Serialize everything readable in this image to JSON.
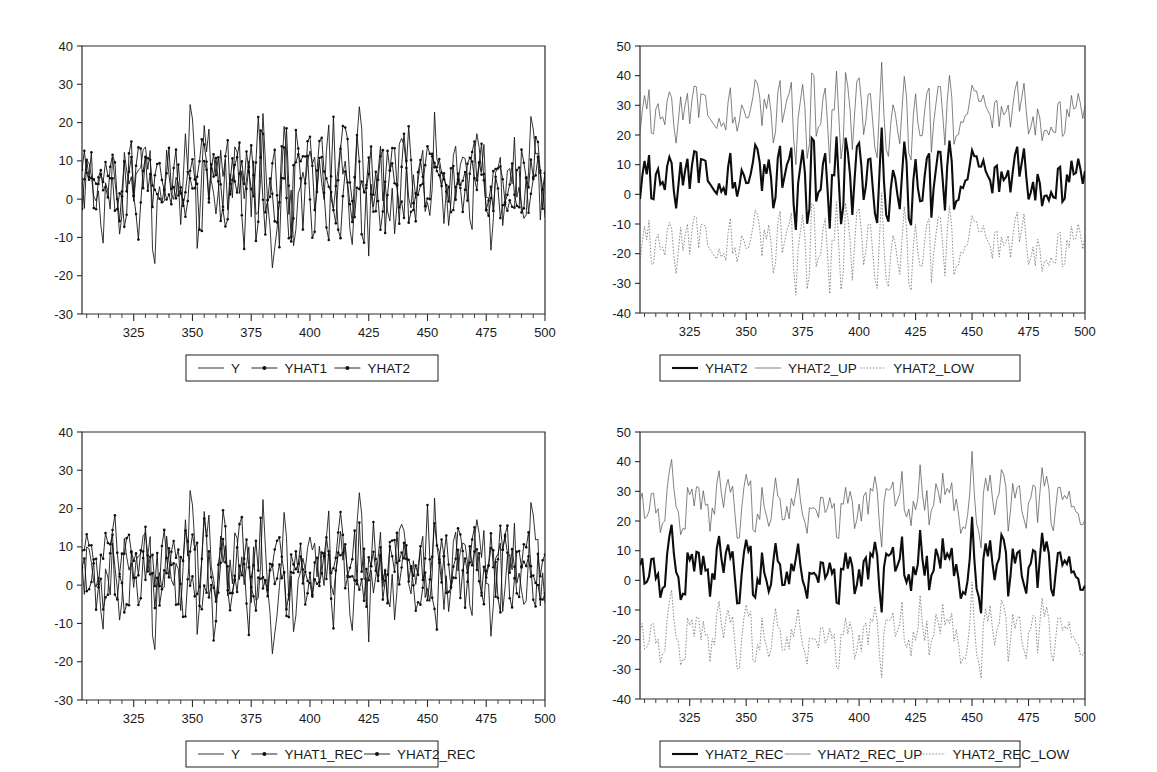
{
  "figure": {
    "layout": "2x2 grid of time series line plots",
    "background": "#ffffff",
    "ink_color": "#111111"
  },
  "chart_data": [
    {
      "id": "top-left",
      "type": "line",
      "title": "",
      "xlabel": "",
      "ylabel": "",
      "xlim": [
        303,
        500
      ],
      "ylim": [
        -30,
        40
      ],
      "ytick_labels": [
        "40",
        "30",
        "20",
        "10",
        "0",
        "-10",
        "-20",
        "-30"
      ],
      "ytick_values": [
        40,
        30,
        20,
        10,
        0,
        -10,
        -20,
        -30
      ],
      "xtick_labels": [
        "325",
        "350",
        "375",
        "400",
        "425",
        "450",
        "475",
        "500"
      ],
      "xtick_values": [
        325,
        350,
        375,
        400,
        425,
        450,
        475,
        500
      ],
      "minor_xtick_step": 5,
      "grid": false,
      "legend_position": "below-center",
      "series": [
        {
          "name": "Y",
          "style": "solid-thin",
          "marker": "none",
          "seed": 11,
          "amp": 16,
          "mean": 4.5,
          "n": 198
        },
        {
          "name": "YHAT1",
          "style": "solid-marker",
          "marker": "dot",
          "seed": 29,
          "amp": 12.5,
          "mean": 4.5,
          "n": 198
        },
        {
          "name": "YHAT2",
          "style": "solid-marker",
          "marker": "dot",
          "seed": 47,
          "amp": 12.0,
          "mean": 4.5,
          "n": 198
        }
      ],
      "legend": [
        "Y",
        "YHAT1",
        "YHAT2"
      ]
    },
    {
      "id": "top-right",
      "type": "line",
      "title": "",
      "xlabel": "",
      "ylabel": "",
      "xlim": [
        303,
        500
      ],
      "ylim": [
        -40,
        50
      ],
      "ytick_labels": [
        "50",
        "40",
        "30",
        "20",
        "10",
        "0",
        "-10",
        "-20",
        "-30",
        "-40"
      ],
      "ytick_values": [
        50,
        40,
        30,
        20,
        10,
        0,
        -10,
        -20,
        -30,
        -40
      ],
      "xtick_labels": [
        "325",
        "350",
        "375",
        "400",
        "425",
        "450",
        "475",
        "500"
      ],
      "xtick_values": [
        325,
        350,
        375,
        400,
        425,
        450,
        475,
        500
      ],
      "minor_xtick_step": 5,
      "grid": false,
      "legend_position": "below-center",
      "series": [
        {
          "name": "YHAT2",
          "style": "solid-thick",
          "marker": "none",
          "seed": 47,
          "amp": 12.0,
          "mean": 5.5,
          "n": 198
        },
        {
          "name": "YHAT2_UP",
          "style": "solid-thin",
          "marker": "none",
          "seed": 47,
          "amp": 12.0,
          "mean": 5.5,
          "offset": 22,
          "n": 198
        },
        {
          "name": "YHAT2_LOW",
          "style": "dotted",
          "marker": "none",
          "seed": 47,
          "amp": 12.0,
          "mean": 5.5,
          "offset": -22,
          "n": 198
        }
      ],
      "legend": [
        "YHAT2",
        "YHAT2_UP",
        "YHAT2_LOW"
      ]
    },
    {
      "id": "bottom-left",
      "type": "line",
      "title": "",
      "xlabel": "",
      "ylabel": "",
      "xlim": [
        303,
        500
      ],
      "ylim": [
        -30,
        40
      ],
      "ytick_labels": [
        "40",
        "30",
        "20",
        "10",
        "0",
        "-10",
        "-20",
        "-30"
      ],
      "ytick_values": [
        40,
        30,
        20,
        10,
        0,
        -10,
        -20,
        -30
      ],
      "xtick_labels": [
        "325",
        "350",
        "375",
        "400",
        "425",
        "450",
        "475",
        "500"
      ],
      "xtick_values": [
        325,
        350,
        375,
        400,
        425,
        450,
        475,
        500
      ],
      "minor_xtick_step": 5,
      "grid": false,
      "legend_position": "below-center",
      "series": [
        {
          "name": "Y",
          "style": "solid-thin",
          "marker": "none",
          "seed": 11,
          "amp": 16,
          "mean": 4.5,
          "n": 198
        },
        {
          "name": "YHAT1_REC",
          "style": "solid-marker",
          "marker": "dot",
          "seed": 31,
          "amp": 12.0,
          "mean": 4.5,
          "n": 198
        },
        {
          "name": "YHAT2_REC",
          "style": "solid-marker",
          "marker": "dot",
          "seed": 53,
          "amp": 11.6,
          "mean": 4.5,
          "n": 198
        }
      ],
      "legend": [
        "Y",
        "YHAT1_REC",
        "YHAT2_REC"
      ]
    },
    {
      "id": "bottom-right",
      "type": "line",
      "title": "",
      "xlabel": "",
      "ylabel": "",
      "xlim": [
        303,
        500
      ],
      "ylim": [
        -40,
        50
      ],
      "ytick_labels": [
        "50",
        "40",
        "30",
        "20",
        "10",
        "0",
        "-10",
        "-20",
        "-30",
        "-40"
      ],
      "ytick_values": [
        50,
        40,
        30,
        20,
        10,
        0,
        -10,
        -20,
        -30,
        -40
      ],
      "xtick_labels": [
        "325",
        "350",
        "375",
        "400",
        "425",
        "450",
        "475",
        "500"
      ],
      "xtick_values": [
        325,
        350,
        375,
        400,
        425,
        450,
        475,
        500
      ],
      "minor_xtick_step": 5,
      "grid": false,
      "legend_position": "below-center",
      "series": [
        {
          "name": "YHAT2_REC",
          "style": "solid-thick",
          "marker": "none",
          "seed": 53,
          "amp": 11.6,
          "mean": 5.0,
          "n": 198
        },
        {
          "name": "YHAT2_REC_UP",
          "style": "solid-thin",
          "marker": "none",
          "seed": 53,
          "amp": 11.6,
          "mean": 5.0,
          "offset": 22,
          "n": 198
        },
        {
          "name": "YHAT2_REC_LOW",
          "style": "dotted",
          "marker": "none",
          "seed": 53,
          "amp": 11.6,
          "mean": 5.0,
          "offset": -22,
          "n": 198
        }
      ],
      "legend": [
        "YHAT2_REC",
        "YHAT2_REC_UP",
        "YHAT2_REC_LOW"
      ]
    }
  ]
}
